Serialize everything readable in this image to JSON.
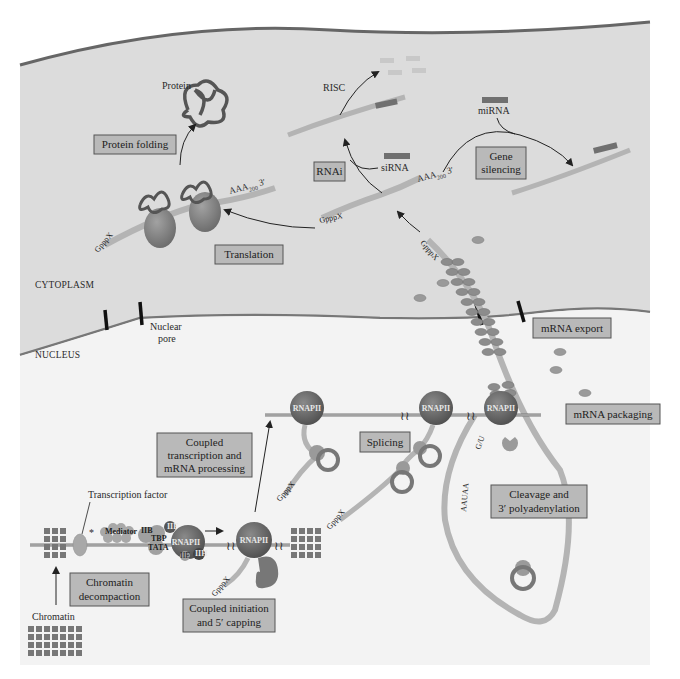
{
  "regions": {
    "cytoplasm": "CYTOPLASM",
    "nucleus": "NUCLEUS"
  },
  "process_boxes": {
    "protein_folding": "Protein folding",
    "translation": "Translation",
    "rnai": "RNAi",
    "gene_silencing_line1": "Gene",
    "gene_silencing_line2": "silencing",
    "mrna_export": "mRNA export",
    "mrna_packaging": "mRNA packaging",
    "coupled_transcription_line1": "Coupled",
    "coupled_transcription_line2": "transcription and",
    "coupled_transcription_line3": "mRNA processing",
    "splicing": "Splicing",
    "cleavage_line1": "Cleavage and",
    "cleavage_line2": "3′ polyadenylation",
    "chromatin_decompaction_line1": "Chromatin",
    "chromatin_decompaction_line2": "decompaction",
    "coupled_initiation_line1": "Coupled initiation",
    "coupled_initiation_line2": "and 5′ capping"
  },
  "labels": {
    "protein": "Protein",
    "risc": "RISC",
    "mirna": "miRNA",
    "sirna": "siRNA",
    "nuclear_pore_line1": "Nuclear",
    "nuclear_pore_line2": "pore",
    "transcription_factor": "Transcription factor",
    "chromatin": "Chromatin",
    "mediator": "Mediator",
    "iib": "IIB",
    "tbp": "TBP",
    "tata": "TATA",
    "iif": "IIF",
    "iie": "IIE",
    "iih": "IIH",
    "rnapii": "RNAPII",
    "cap": "GpppX",
    "five_prime": "5′",
    "polya_tail": "AAA",
    "polya_sub": "200",
    "three_prime": "3′",
    "aauaa": "AAUAA",
    "gu": "G/U",
    "asterisk": "*"
  },
  "colors": {
    "cytoplasm_bg": "#dcdcdc",
    "nucleus_bg": "#f4f4f4",
    "box_fill": "#b9b9b9",
    "box_stroke": "#555555",
    "rna_strand": "#b0b0b0",
    "protein_dark": "#6f6f6f",
    "ribosome": "#8a8a8a",
    "rnapii": "#6a6a6a",
    "membrane": "#777777",
    "pore": "#111111"
  }
}
